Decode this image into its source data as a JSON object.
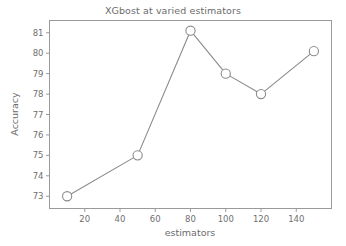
{
  "chart_data": {
    "type": "line",
    "title": "XGbost at varied estimators",
    "xlabel": "estimators",
    "ylabel": "Accuracy",
    "x": [
      10,
      50,
      80,
      100,
      120,
      150
    ],
    "values": [
      73,
      75,
      81.1,
      79,
      78,
      80.1
    ],
    "series": [
      {
        "name": "Accuracy",
        "x": [
          10,
          50,
          80,
          100,
          120,
          150
        ],
        "values": [
          73,
          75,
          81.1,
          79,
          78,
          80.1
        ]
      }
    ],
    "xlim": [
      0,
      160
    ],
    "ylim": [
      72.4,
      81.6
    ],
    "xticks": [
      20,
      40,
      60,
      80,
      100,
      120,
      140
    ],
    "yticks": [
      73,
      74,
      75,
      76,
      77,
      78,
      79,
      80,
      81
    ],
    "xticklabels": [
      "20",
      "40",
      "60",
      "80",
      "100",
      "120",
      "140"
    ],
    "yticklabels": [
      "73",
      "74",
      "75",
      "76",
      "77",
      "78",
      "79",
      "80",
      "81"
    ],
    "grid": false,
    "legend": null,
    "marker": "open-circle",
    "line_color": "#8a8a8a",
    "marker_facecolor": "#ffffff",
    "marker_edgecolor": "#8a8a8a",
    "background": "#ffffff"
  }
}
